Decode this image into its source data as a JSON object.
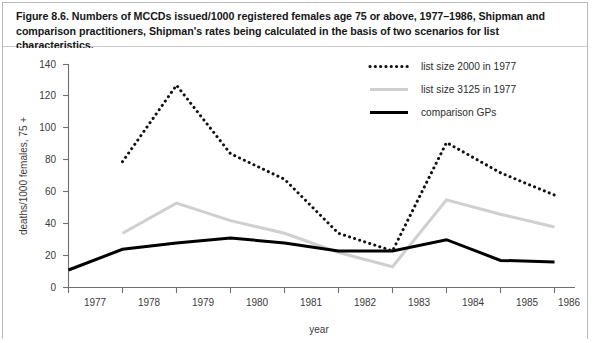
{
  "figure": {
    "caption": "Figure 8.6. Numbers of MCCDs issued/1000 registered females age 75 or above, 1977–1986, Shipman and comparison practitioners, Shipman's rates being calculated in the basis of two scenarios for list characteristics."
  },
  "chart_data": {
    "type": "line",
    "title": "Figure 8.6. Numbers of MCCDs issued/1000 registered females age 75 or above, 1977–1986, Shipman and comparison practitioners, Shipman's rates being calculated in the basis of two scenarios for list characteristics.",
    "xlabel": "year",
    "ylabel": "deaths/1000 females, 75 +",
    "categories": [
      "1977",
      "1978",
      "1979",
      "1980",
      "1981",
      "1982",
      "1983",
      "1984",
      "1985",
      "1986"
    ],
    "x_tick_labels": [
      "1977",
      "1978",
      "1979",
      "1980",
      "1981",
      "1982",
      "1983",
      "1984",
      "1985",
      "1986"
    ],
    "y_tick_labels": [
      "0",
      "20",
      "40",
      "60",
      "80",
      "100",
      "120",
      "140"
    ],
    "ylim": [
      0,
      140
    ],
    "ytick_step": 20,
    "grid": false,
    "legend_position": "top-right",
    "series": [
      {
        "name": "list size 2000 in 1977",
        "style": "dotted",
        "color": "#111111",
        "x": [
          "1978",
          "1979",
          "1980",
          "1981",
          "1982",
          "1983",
          "1984",
          "1985",
          "1986"
        ],
        "values": [
          79,
          127,
          84,
          68,
          34,
          23,
          91,
          72,
          58
        ]
      },
      {
        "name": "list size 3125 in 1977",
        "style": "solid",
        "color": "#cfcfcf",
        "x": [
          "1978",
          "1979",
          "1980",
          "1981",
          "1982",
          "1983",
          "1984",
          "1985",
          "1986"
        ],
        "values": [
          34,
          53,
          42,
          34,
          22,
          13,
          55,
          46,
          38
        ]
      },
      {
        "name": "comparison GPs",
        "style": "solid",
        "color": "#000000",
        "x": [
          "1977",
          "1978",
          "1979",
          "1980",
          "1981",
          "1982",
          "1983",
          "1984",
          "1985",
          "1986"
        ],
        "values": [
          11,
          24,
          28,
          31,
          28,
          23,
          23,
          30,
          17,
          16
        ]
      }
    ]
  },
  "legend": {
    "items": [
      {
        "label": "list size 2000 in 1977",
        "style": "dotted",
        "color": "#111111"
      },
      {
        "label": "list size 3125 in 1977",
        "style": "solid",
        "color": "#cfcfcf"
      },
      {
        "label": "comparison GPs",
        "style": "solid",
        "color": "#000000"
      }
    ]
  },
  "axes": {
    "x_title": "year",
    "y_title": "deaths/1000 females, 75 +"
  }
}
